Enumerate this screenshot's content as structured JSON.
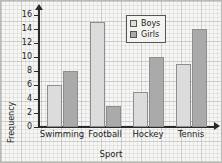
{
  "chart_data": {
    "type": "bar",
    "title": "",
    "xlabel": "Sport",
    "ylabel": "Frequency",
    "categories": [
      "Swimming",
      "Football",
      "Hockey",
      "Tennis"
    ],
    "series": [
      {
        "name": "Boys",
        "values": [
          6,
          15,
          5,
          9
        ],
        "color": "#dcdcdc"
      },
      {
        "name": "Girls",
        "values": [
          8,
          3,
          10,
          14
        ],
        "color": "#aaaaaa"
      }
    ],
    "ylim": [
      0,
      16
    ],
    "ytick_step": 2,
    "yticks": [
      0,
      2,
      4,
      6,
      8,
      10,
      12,
      14,
      16
    ],
    "ytick_labels": [
      "0",
      "2",
      "4",
      "6",
      "8",
      "10",
      "12",
      "14",
      "16"
    ],
    "grid": true,
    "grid_style": "graph-paper",
    "legend_position": "top-right",
    "axis_arrows": true
  }
}
